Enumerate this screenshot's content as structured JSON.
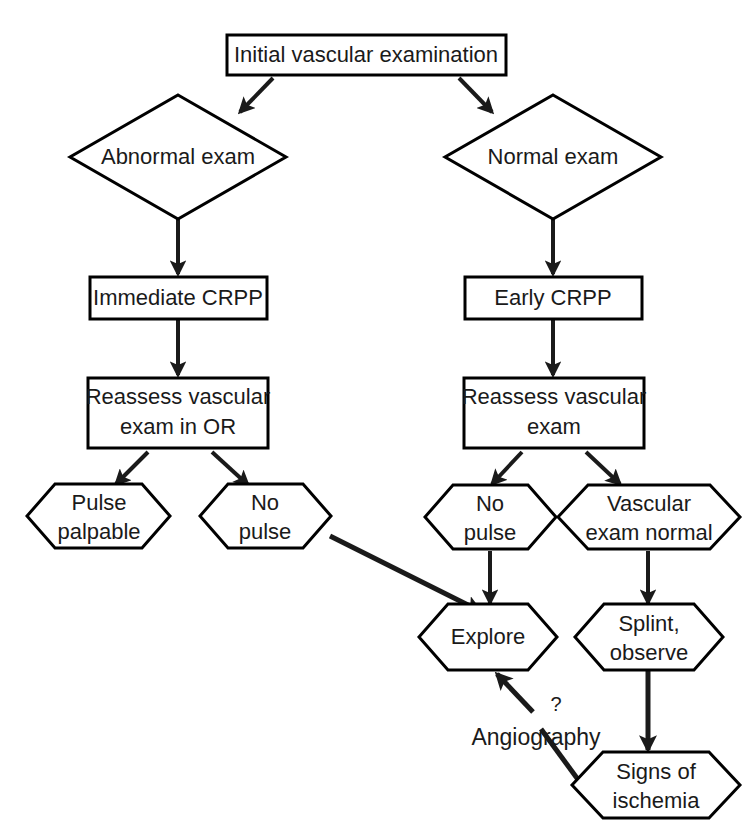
{
  "diagram": {
    "background_color": "#ffffff",
    "line_color": "#1a1a1a",
    "text_color": "#1a1a1a",
    "nodes": {
      "initial_exam": {
        "label": "Initial vascular examination",
        "shape": "rectangle"
      },
      "abnormal_exam": {
        "label": "Abnormal exam",
        "shape": "diamond"
      },
      "normal_exam": {
        "label": "Normal exam",
        "shape": "diamond"
      },
      "immediate_crpp": {
        "label": "Immediate CRPP",
        "shape": "rectangle"
      },
      "early_crpp": {
        "label": "Early CRPP",
        "shape": "rectangle"
      },
      "reassess_or_line1": {
        "label": "Reassess vascular",
        "shape": "rectangle"
      },
      "reassess_or_line2": {
        "label": "exam in OR",
        "shape": "rectangle"
      },
      "reassess_line1": {
        "label": "Reassess vascular",
        "shape": "rectangle"
      },
      "reassess_line2": {
        "label": "exam",
        "shape": "rectangle"
      },
      "pulse_palpable_line1": {
        "label": "Pulse",
        "shape": "hexagon"
      },
      "pulse_palpable_line2": {
        "label": "palpable",
        "shape": "hexagon"
      },
      "no_pulse_left_line1": {
        "label": "No",
        "shape": "hexagon"
      },
      "no_pulse_left_line2": {
        "label": "pulse",
        "shape": "hexagon"
      },
      "no_pulse_right_line1": {
        "label": "No",
        "shape": "hexagon"
      },
      "no_pulse_right_line2": {
        "label": "pulse",
        "shape": "hexagon"
      },
      "vascular_normal_line1": {
        "label": "Vascular",
        "shape": "hexagon"
      },
      "vascular_normal_line2": {
        "label": "exam normal",
        "shape": "hexagon"
      },
      "explore": {
        "label": "Explore",
        "shape": "hexagon"
      },
      "splint_line1": {
        "label": "Splint,",
        "shape": "hexagon"
      },
      "splint_line2": {
        "label": "observe",
        "shape": "hexagon"
      },
      "signs_ischemia_line1": {
        "label": "Signs of",
        "shape": "hexagon"
      },
      "signs_ischemia_line2": {
        "label": "ischemia",
        "shape": "hexagon"
      }
    },
    "annotations": {
      "angiography": "Angiography",
      "question_mark": "?"
    }
  }
}
